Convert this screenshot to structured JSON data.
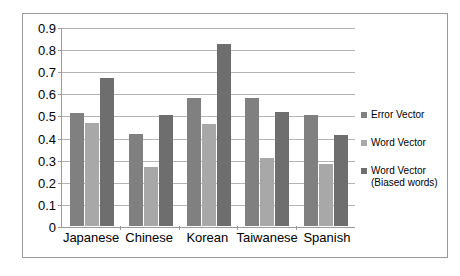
{
  "chart_data": {
    "type": "bar",
    "title": "",
    "xlabel": "",
    "ylabel": "",
    "ylim": [
      0,
      0.9
    ],
    "grid": true,
    "legend_position": "right",
    "categories": [
      "Japanese",
      "Chinese",
      "Korean",
      "Taiwanese",
      "Spanish"
    ],
    "y_ticks": [
      "0",
      "0.1",
      "0.2",
      "0.3",
      "0.4",
      "0.5",
      "0.6",
      "0.7",
      "0.8",
      "0.9"
    ],
    "y_tick_values": [
      0,
      0.1,
      0.2,
      0.3,
      0.4,
      0.5,
      0.6,
      0.7,
      0.8,
      0.9
    ],
    "series": [
      {
        "name": "Error Vector",
        "color": "#808080",
        "values": [
          0.51,
          0.415,
          0.575,
          0.575,
          0.5
        ]
      },
      {
        "name": "Word Vector",
        "color": "#a8a8a8",
        "values": [
          0.465,
          0.265,
          0.46,
          0.305,
          0.28
        ]
      },
      {
        "name": "Word Vector\n(Biased words)",
        "color": "#6e6e6e",
        "values": [
          0.665,
          0.5,
          0.82,
          0.515,
          0.41
        ]
      }
    ]
  },
  "colors": {
    "frame_border": "#9a9a9a",
    "axis": "#9a9a9a",
    "gridline": "#b4b4b4",
    "background": "#ffffff",
    "text": "#000000"
  }
}
